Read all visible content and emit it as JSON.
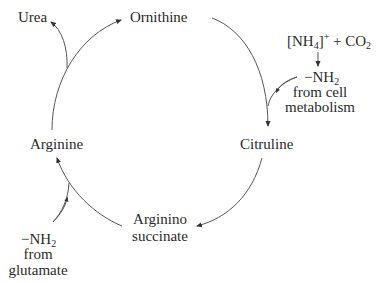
{
  "diagram": {
    "nodes": {
      "ornithine": "Ornithine",
      "citruline": "Citruline",
      "arginino_line1": "Arginino",
      "arginino_line2": "succinate",
      "arginine": "Arginine",
      "urea": "Urea"
    },
    "inputs": {
      "top_right": {
        "reactant_bracket_open": "[NH",
        "reactant_sub": "4",
        "reactant_bracket_close": "]",
        "reactant_sup": "+",
        "plus": " + CO",
        "co2_sub": "2",
        "product_prefix": "−NH",
        "product_sub": "2",
        "line2": "from cell",
        "line3": "metabolism"
      },
      "bottom_left": {
        "product_prefix": "−NH",
        "product_sub": "2",
        "line2": "from",
        "line3": "glutamate"
      }
    },
    "edges": [
      {
        "from": "Ornithine",
        "to": "Citruline"
      },
      {
        "from": "-NH2 from cell metabolism",
        "to": "Citruline"
      },
      {
        "from": "Citruline",
        "to": "Arginino succinate"
      },
      {
        "from": "Arginino succinate",
        "to": "Arginine"
      },
      {
        "from": "-NH2 from glutamate",
        "to": "Arginine"
      },
      {
        "from": "Arginine",
        "to": "Ornithine"
      },
      {
        "from": "Arginine",
        "to": "Urea"
      }
    ],
    "colors": {
      "text": "#2a2a2a",
      "line": "#555555",
      "background": "#ffffff"
    }
  }
}
